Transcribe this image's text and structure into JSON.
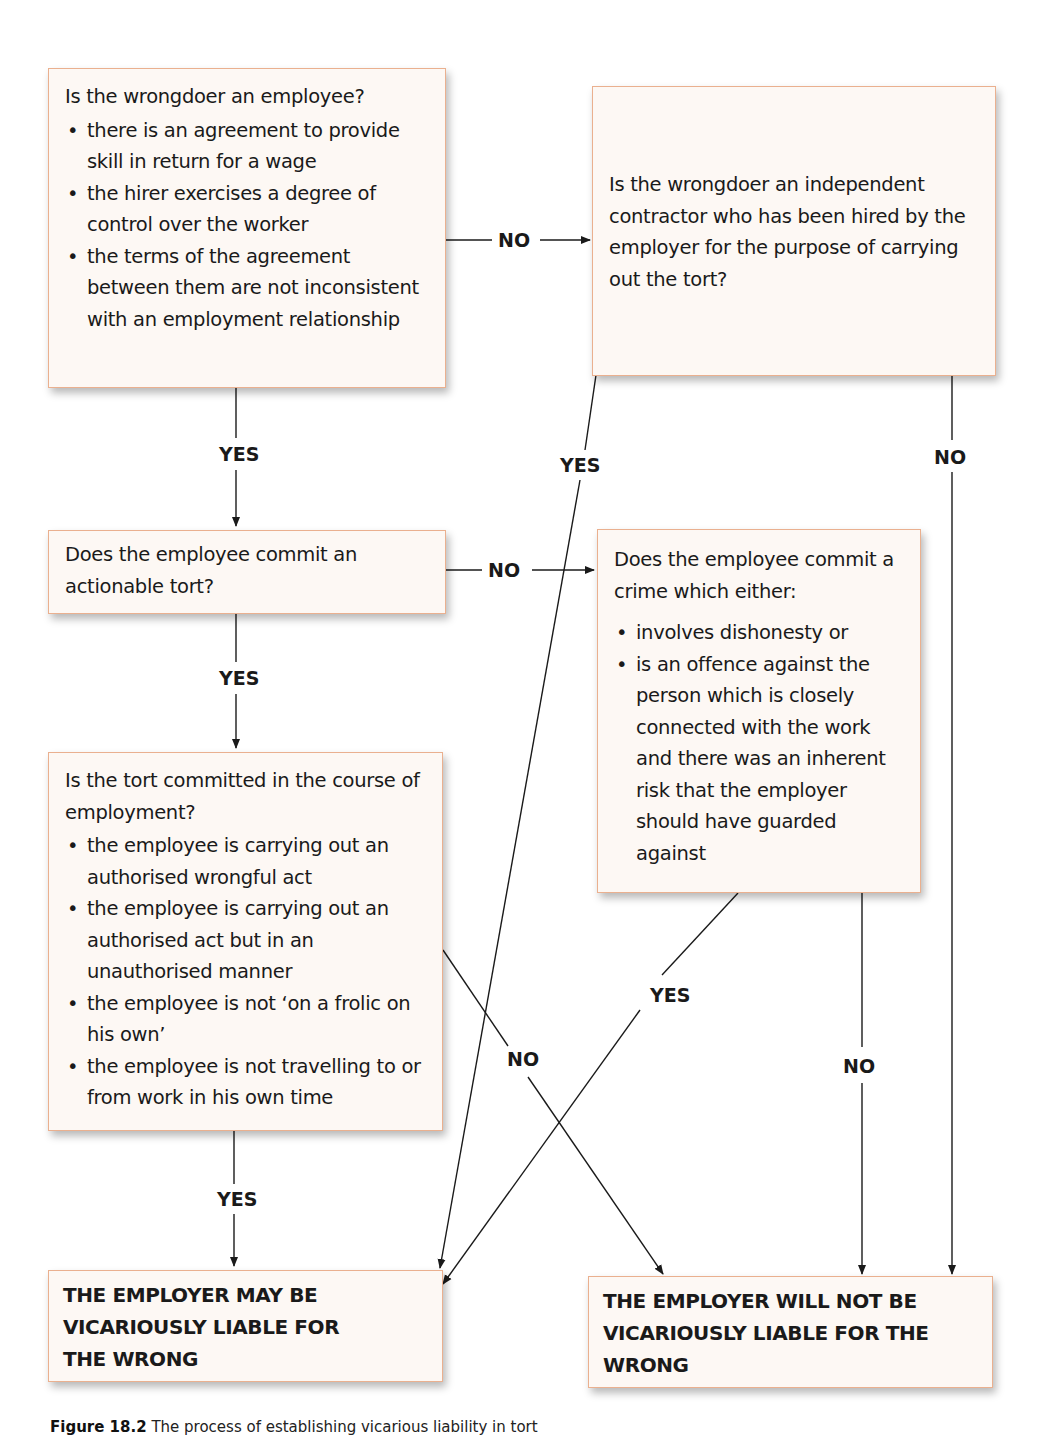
{
  "diagram": {
    "nodes": {
      "employee_q": {
        "question": "Is the wrongdoer an employee?",
        "bullets": [
          "there is an agreement to provide skill in return for a wage",
          "the hirer exercises a degree of control over the worker",
          "the terms of the agreement between them are not inconsistent with an employment relationship"
        ]
      },
      "contractor_q": {
        "question": "Is the wrongdoer an independent contractor who has been hired by the employer for the purpose of carrying out the tort?"
      },
      "tort_q": {
        "question": "Does the employee commit an actionable tort?"
      },
      "crime_q": {
        "question": "Does the employee commit a crime which either:",
        "bullets": [
          "involves dishonesty or",
          "is an offence against the person which is closely connected with the work and there was an inherent risk that the employer should have guarded against"
        ]
      },
      "course_q": {
        "question": "Is the tort committed in the course of employment?",
        "bullets": [
          "the employee is carrying out an authorised wrongful act",
          "the employee is carrying out an authorised act but in an unauthorised manner",
          "the employee is not ‘on a frolic on his own’",
          "the employee is not travelling to or from work in his own time"
        ]
      },
      "liable": {
        "text": "THE EMPLOYER MAY BE VICARIOUSLY LIABLE FOR THE WRONG"
      },
      "not_liable": {
        "text": "THE EMPLOYER WILL NOT BE VICARIOUSLY LIABLE FOR THE WRONG"
      }
    },
    "edge_labels": {
      "employee_no": "NO",
      "employee_yes": "YES",
      "contractor_yes": "YES",
      "contractor_no": "NO",
      "tort_no": "NO",
      "tort_yes": "YES",
      "crime_yes": "YES",
      "crime_no": "NO",
      "course_no": "NO",
      "course_yes": "YES"
    },
    "colors": {
      "box_fill": "#fdf8f4",
      "box_border": "#eab08f",
      "line": "#1a1a1a"
    }
  },
  "caption": {
    "label": "Figure 18.2",
    "text": "The process of establishing vicarious liability in tort"
  }
}
